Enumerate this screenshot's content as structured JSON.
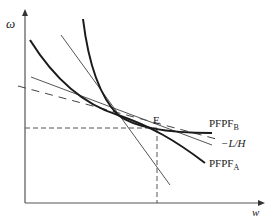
{
  "axes": {
    "y_label": "ω",
    "x_label": "w"
  },
  "labels": {
    "point_e": "E",
    "pfpf_b": "PFPF",
    "pfpf_b_sub": "B",
    "slope": "−L/H",
    "pfpf_a": "PFPF",
    "pfpf_a_sub": "A"
  },
  "colors": {
    "curve": "#1a1a1a",
    "line": "#555555",
    "dash": "#444444"
  }
}
